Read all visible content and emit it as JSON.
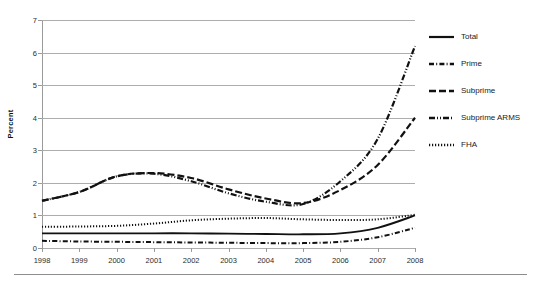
{
  "chart_data": {
    "type": "line",
    "title": "",
    "xlabel": "",
    "ylabel": "Percent",
    "x": [
      1998,
      1999,
      2000,
      2001,
      2002,
      2003,
      2004,
      2005,
      2006,
      2007,
      2008
    ],
    "categories": [
      "1998",
      "1999",
      "2000",
      "2001",
      "2002",
      "2003",
      "2004",
      "2005",
      "2006",
      "2007",
      "2008"
    ],
    "ylim": [
      0,
      7
    ],
    "yticks": [
      0,
      1,
      2,
      3,
      4,
      5,
      6,
      7
    ],
    "ytick_labels": [
      "0",
      "1",
      "2",
      "3",
      "4",
      "5",
      "6",
      "7"
    ],
    "grid": "horizontal",
    "legend_position": "right",
    "series": [
      {
        "name": "Total",
        "style": "solid",
        "values": [
          0.45,
          0.45,
          0.45,
          0.45,
          0.45,
          0.44,
          0.43,
          0.42,
          0.45,
          0.62,
          1.0
        ]
      },
      {
        "name": "Prime",
        "style": "dash-dot",
        "values": [
          0.22,
          0.2,
          0.19,
          0.18,
          0.17,
          0.16,
          0.15,
          0.15,
          0.19,
          0.33,
          0.62
        ]
      },
      {
        "name": "Subprime",
        "style": "dashed",
        "values": [
          1.45,
          1.72,
          2.2,
          2.3,
          2.15,
          1.8,
          1.52,
          1.38,
          1.78,
          2.55,
          4.0
        ]
      },
      {
        "name": "Subprime ARMS",
        "style": "dash-dot-dot",
        "values": [
          1.45,
          1.72,
          2.2,
          2.28,
          2.05,
          1.68,
          1.42,
          1.35,
          2.05,
          3.35,
          6.2
        ]
      },
      {
        "name": "FHA",
        "style": "dotted",
        "values": [
          0.65,
          0.66,
          0.68,
          0.75,
          0.85,
          0.9,
          0.92,
          0.88,
          0.86,
          0.88,
          1.02
        ]
      }
    ]
  },
  "legend": {
    "items": [
      {
        "label": "Total",
        "swatch": "solid-line-swatch"
      },
      {
        "label": "Prime",
        "swatch": "dash-dot-line-swatch"
      },
      {
        "label": "Subprime",
        "swatch": "dashed-line-swatch"
      },
      {
        "label": "Subprime ARMS",
        "swatch": "dash-dot-dot-line-swatch"
      },
      {
        "label": "FHA",
        "swatch": "dotted-line-swatch"
      }
    ]
  },
  "colors": {
    "series": "#111111",
    "gridline": "#adadad",
    "axis": "#9a9a9a",
    "text": "#1a1a1a",
    "background": "#ffffff"
  }
}
